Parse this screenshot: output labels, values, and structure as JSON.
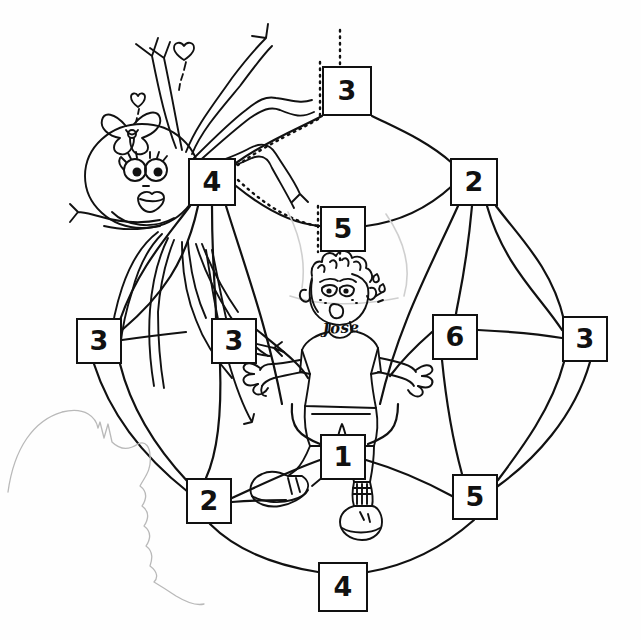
{
  "worksheet": {
    "title": "Spider Web Number Maze Coloring Page",
    "character_name": "Jose",
    "shirt_text": "Jose",
    "ink_color": "#111111",
    "paper_color": "#fefefe"
  },
  "icons": {
    "spider": "spider-icon",
    "spider_bow": "bow-icon",
    "heart_small": "heart-icon",
    "boy": "boy-icon",
    "web": "spider-web-icon",
    "pencil_smudge": "pencil-smudge-icon"
  },
  "web": {
    "description": "Hand drawn spider web with numbered squares at the node intersections",
    "node_count": 12,
    "nodes": [
      {
        "id": "top",
        "value": "3",
        "x": 322,
        "y": 66,
        "w": 50,
        "h": 50,
        "dotted_tail": true
      },
      {
        "id": "upper-left",
        "value": "4",
        "x": 188,
        "y": 158,
        "w": 48,
        "h": 48,
        "dotted_tail": false
      },
      {
        "id": "upper-right",
        "value": "2",
        "x": 450,
        "y": 158,
        "w": 48,
        "h": 48,
        "dotted_tail": false
      },
      {
        "id": "center-upper",
        "value": "5",
        "x": 320,
        "y": 206,
        "w": 46,
        "h": 46,
        "dotted_tail": true
      },
      {
        "id": "far-left",
        "value": "3",
        "x": 76,
        "y": 318,
        "w": 46,
        "h": 46,
        "dotted_tail": false
      },
      {
        "id": "mid-left",
        "value": "3",
        "x": 211,
        "y": 318,
        "w": 46,
        "h": 46,
        "dotted_tail": false
      },
      {
        "id": "mid-right",
        "value": "6",
        "x": 432,
        "y": 314,
        "w": 46,
        "h": 46,
        "dotted_tail": false
      },
      {
        "id": "far-right",
        "value": "3",
        "x": 562,
        "y": 316,
        "w": 46,
        "h": 46,
        "dotted_tail": false
      },
      {
        "id": "center-lower",
        "value": "1",
        "x": 320,
        "y": 434,
        "w": 46,
        "h": 46,
        "dotted_tail": false
      },
      {
        "id": "lower-left",
        "value": "2",
        "x": 186,
        "y": 478,
        "w": 46,
        "h": 46,
        "dotted_tail": false
      },
      {
        "id": "lower-right",
        "value": "5",
        "x": 452,
        "y": 474,
        "w": 46,
        "h": 46,
        "dotted_tail": false
      },
      {
        "id": "bottom",
        "value": "4",
        "x": 318,
        "y": 562,
        "w": 50,
        "h": 50,
        "dotted_tail": false
      }
    ]
  }
}
